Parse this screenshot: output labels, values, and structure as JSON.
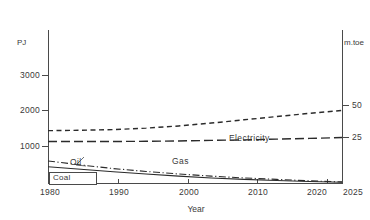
{
  "chart_data": {
    "type": "line",
    "title": "",
    "xlabel": "Year",
    "ylabel": "PJ",
    "ylabel_right": "m.toe",
    "xlim": [
      1980,
      2025
    ],
    "ylim": [
      0,
      3300
    ],
    "ylim_right": [
      0,
      78.8
    ],
    "grid": false,
    "legend_position": "inline-annotations",
    "x_ticks": [
      1980,
      1990,
      2000,
      2010,
      2020,
      2025
    ],
    "x_tick_labels": [
      "1980",
      "1990",
      "2000",
      "2010",
      "2020",
      "2025"
    ],
    "y_ticks_left": [
      1000,
      2000,
      3000
    ],
    "y_tick_labels_left": [
      "1000",
      "2000",
      "3000"
    ],
    "y_ticks_right": [
      25,
      50
    ],
    "y_tick_labels_right": [
      "25",
      "50"
    ],
    "series": [
      {
        "name": "Electricity",
        "style": "short-dashed",
        "x": [
          1980,
          1985,
          1990,
          1995,
          2000,
          2005,
          2010,
          2015,
          2020,
          2025
        ],
        "values": [
          1450,
          1460,
          1480,
          1520,
          1580,
          1660,
          1750,
          1840,
          1930,
          2010
        ]
      },
      {
        "name": "Gas",
        "style": "long-dashed",
        "x": [
          1980,
          1985,
          1990,
          1995,
          2000,
          2005,
          2010,
          2015,
          2020,
          2025
        ],
        "values": [
          1150,
          1150,
          1150,
          1155,
          1165,
          1180,
          1195,
          1215,
          1235,
          1260
        ]
      },
      {
        "name": "Oil",
        "style": "dash-dot",
        "x": [
          1980,
          1985,
          1990,
          1995,
          2000,
          2005,
          2010,
          2015,
          2020,
          2025
        ],
        "values": [
          610,
          500,
          400,
          320,
          250,
          190,
          140,
          100,
          60,
          30
        ]
      },
      {
        "name": "Coal",
        "style": "solid",
        "x": [
          1980,
          1985,
          1990,
          1995,
          2000,
          2005,
          2010,
          2015,
          2020,
          2025
        ],
        "values": [
          450,
          380,
          310,
          250,
          190,
          140,
          100,
          70,
          40,
          20
        ]
      }
    ],
    "annotations": [
      {
        "text": "Electricity",
        "x": 2012,
        "y": 1620
      },
      {
        "text": "Gas",
        "x": 2001,
        "y": 960
      },
      {
        "text": "Oil",
        "x": 1985,
        "y": 900,
        "leader": true
      },
      {
        "text": "Coal",
        "x": 1981,
        "y": 240,
        "boxed": true
      }
    ]
  },
  "axes": {
    "unit_left": "PJ",
    "unit_right": "m.toe",
    "x_title": "Year"
  }
}
